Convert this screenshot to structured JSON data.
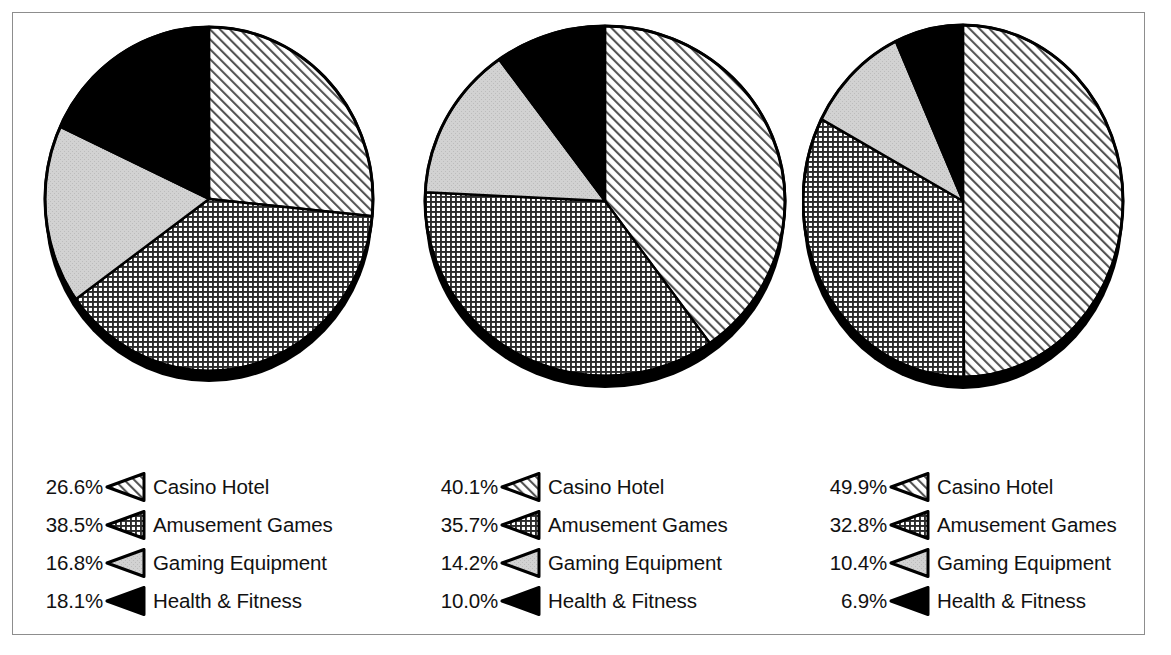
{
  "chart_data": [
    {
      "type": "pie",
      "title": "",
      "categories": [
        "Casino Hotel",
        "Amusement Games",
        "Gaming Equipment",
        "Health & Fitness"
      ],
      "values": [
        26.6,
        38.5,
        16.8,
        18.1
      ],
      "value_labels": [
        "26.6%",
        "38.5%",
        "16.8%",
        "18.1%"
      ],
      "patterns": [
        "diagonal-hatch",
        "cross-hatch",
        "light-gray",
        "solid-black"
      ],
      "legend_position": "bottom",
      "start_angle_deg": 0,
      "direction": "clockwise"
    },
    {
      "type": "pie",
      "title": "",
      "categories": [
        "Casino Hotel",
        "Amusement Games",
        "Gaming Equipment",
        "Health & Fitness"
      ],
      "values": [
        40.1,
        35.7,
        14.2,
        10.0
      ],
      "value_labels": [
        "40.1%",
        "35.7%",
        "14.2%",
        "10.0%"
      ],
      "patterns": [
        "diagonal-hatch",
        "cross-hatch",
        "light-gray",
        "solid-black"
      ],
      "legend_position": "bottom",
      "start_angle_deg": 0,
      "direction": "clockwise"
    },
    {
      "type": "pie",
      "title": "",
      "categories": [
        "Casino Hotel",
        "Amusement Games",
        "Gaming Equipment",
        "Health & Fitness"
      ],
      "values": [
        49.9,
        32.8,
        10.4,
        6.9
      ],
      "value_labels": [
        "49.9%",
        "32.8%",
        "10.4%",
        "6.9%"
      ],
      "patterns": [
        "diagonal-hatch",
        "cross-hatch",
        "light-gray",
        "solid-black"
      ],
      "legend_position": "bottom",
      "start_angle_deg": 0,
      "direction": "clockwise"
    }
  ],
  "colors": {
    "outline": "#000000",
    "gray_fill": "#d2d2d2",
    "black_fill": "#000000",
    "white_fill": "#ffffff",
    "frame": "#8d8d8d",
    "text": "#111111"
  },
  "charts": [
    {
      "legend": [
        {
          "pct": "26.6%",
          "label": "Casino Hotel",
          "pattern": "diagonal-hatch"
        },
        {
          "pct": "38.5%",
          "label": "Amusement Games",
          "pattern": "cross-hatch"
        },
        {
          "pct": "16.8%",
          "label": "Gaming Equipment",
          "pattern": "light-gray"
        },
        {
          "pct": "18.1%",
          "label": "Health & Fitness",
          "pattern": "solid-black"
        }
      ]
    },
    {
      "legend": [
        {
          "pct": "40.1%",
          "label": "Casino Hotel",
          "pattern": "diagonal-hatch"
        },
        {
          "pct": "35.7%",
          "label": "Amusement Games",
          "pattern": "cross-hatch"
        },
        {
          "pct": "14.2%",
          "label": "Gaming Equipment",
          "pattern": "light-gray"
        },
        {
          "pct": "10.0%",
          "label": "Health & Fitness",
          "pattern": "solid-black"
        }
      ]
    },
    {
      "legend": [
        {
          "pct": "49.9%",
          "label": "Casino Hotel",
          "pattern": "diagonal-hatch"
        },
        {
          "pct": "32.8%",
          "label": "Amusement Games",
          "pattern": "cross-hatch"
        },
        {
          "pct": "10.4%",
          "label": "Gaming Equipment",
          "pattern": "light-gray"
        },
        {
          "pct": "6.9%",
          "label": "Health & Fitness",
          "pattern": "solid-black"
        }
      ]
    }
  ]
}
